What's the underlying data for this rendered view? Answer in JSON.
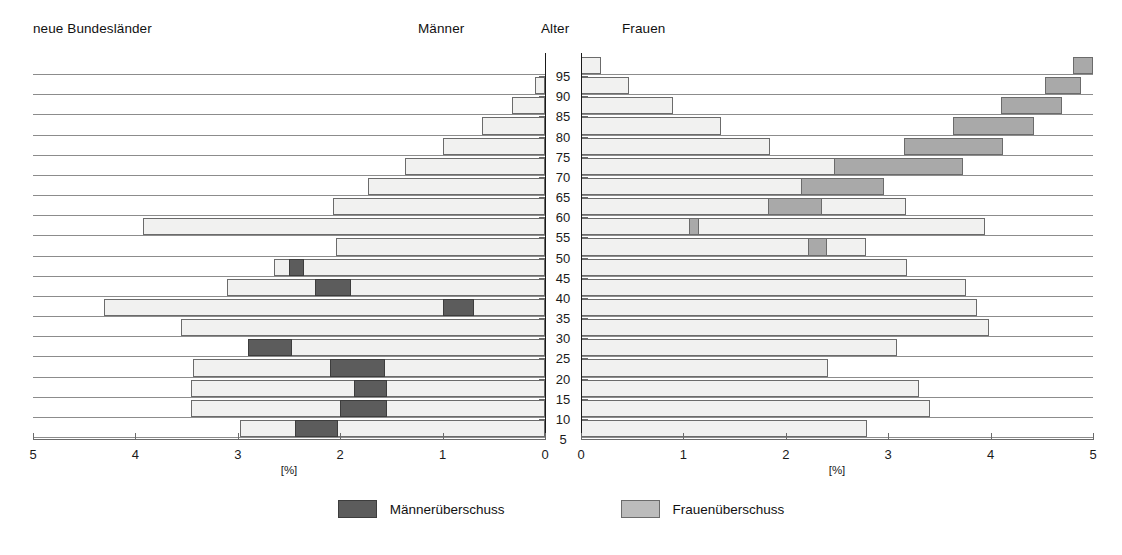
{
  "header": {
    "title": "neue Bundesländer",
    "male_label": "Männer",
    "age_label": "Alter",
    "female_label": "Frauen"
  },
  "legend": {
    "items": [
      {
        "label": "Männerüberschuss",
        "swatch": "male-surplus-swatch",
        "color": "#5c5c5c"
      },
      {
        "label": "Frauenüberschuss",
        "swatch": "female-surplus-swatch",
        "color": "#bcbcbc"
      }
    ]
  },
  "axes": {
    "x_unit": "[%]",
    "x_ticks_left": [
      "5",
      "4",
      "3",
      "2",
      "1",
      "0"
    ],
    "x_ticks_right": [
      "0",
      "1",
      "2",
      "3",
      "4",
      "5"
    ],
    "y_ticks": [
      "95",
      "90",
      "85",
      "80",
      "75",
      "70",
      "65",
      "60",
      "55",
      "50",
      "45",
      "40",
      "35",
      "30",
      "25",
      "20",
      "15",
      "10",
      "5"
    ]
  },
  "chart_data": {
    "type": "bar",
    "subtype": "population-pyramid",
    "title": "neue Bundesländer",
    "xlabel": "[%]",
    "ylabel": "Alter",
    "xlim": [
      0,
      5
    ],
    "grid": true,
    "legend_position": "bottom-center",
    "categories": [
      "95+",
      "90",
      "85",
      "80",
      "75",
      "70",
      "65",
      "60",
      "55",
      "50",
      "45",
      "40",
      "35",
      "30",
      "25",
      "20",
      "15",
      "10",
      "5"
    ],
    "series": [
      {
        "name": "Männer",
        "side": "left",
        "values": [
          0.0,
          0.1,
          0.32,
          0.62,
          1.0,
          1.37,
          1.73,
          2.07,
          3.93,
          2.04,
          2.65,
          3.11,
          4.31,
          3.55,
          2.53,
          3.44,
          3.46,
          3.46,
          2.98
        ],
        "surplus_values": [
          0.0,
          0.0,
          0.0,
          0.0,
          0.0,
          0.0,
          0.0,
          0.0,
          0.0,
          0.0,
          0.15,
          0.36,
          0.31,
          0.0,
          0.43,
          0.54,
          0.33,
          0.46,
          0.42
        ]
      },
      {
        "name": "Frauen",
        "side": "right",
        "values": [
          0.2,
          0.47,
          0.9,
          1.37,
          1.85,
          2.53,
          2.85,
          3.17,
          3.95,
          2.78,
          3.18,
          3.76,
          3.87,
          3.98,
          3.09,
          2.41,
          3.3,
          3.41,
          2.79
        ],
        "surplus_values": [
          0.2,
          0.35,
          0.6,
          0.79,
          0.97,
          1.26,
          0.81,
          0.52,
          0.1,
          0.18,
          0.0,
          0.0,
          0.0,
          0.0,
          0.0,
          0.0,
          0.0,
          0.0,
          0.0
        ]
      }
    ]
  }
}
